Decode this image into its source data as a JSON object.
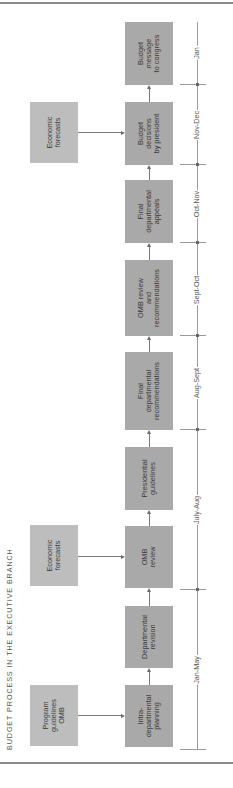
{
  "title": "BUDGET PROCESS IN THE EXECUTIVE BRANCH",
  "colors": {
    "main_box": "#a9a9a9",
    "side_box": "#bdbdbd",
    "line": "#7a7a7a",
    "text": "#3a3a3a"
  },
  "main_steps": [
    {
      "label": "Intra-\ndepartmental\nplanning"
    },
    {
      "label": "Departmental\nrevision"
    },
    {
      "label": "OMB\nreview"
    },
    {
      "label": "Presidential\nguidelines"
    },
    {
      "label": "Final\ndepartmental\nrecommendations"
    },
    {
      "label": "OMB review\nand\nrecommendations"
    },
    {
      "label": "Final\ndepartmental\nappeals"
    },
    {
      "label": "Budget\ndecisions\nby president"
    },
    {
      "label": "Budget\nmessage\nto congress"
    }
  ],
  "inputs": [
    {
      "label": "Program\nguidelines\nOMB",
      "feeds": "Intra-departmental planning"
    },
    {
      "label": "Economic\nforecasts",
      "feeds": "OMB review"
    },
    {
      "label": "Economic\nforecasts",
      "feeds": "Budget decisions by president"
    }
  ],
  "timeline": [
    {
      "label": "Jan-May"
    },
    {
      "label": "July-Aug"
    },
    {
      "label": "Aug-Sept"
    },
    {
      "label": "Sept-Oct"
    },
    {
      "label": "Oct-Nov"
    },
    {
      "label": "Nov-Dec"
    },
    {
      "label": "Jan"
    }
  ]
}
